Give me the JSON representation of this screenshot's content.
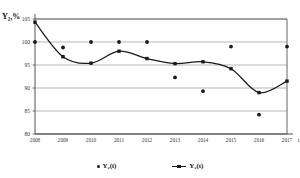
{
  "chart_data": {
    "type": "line",
    "title": "",
    "xlabel": "t, і",
    "ylabel": "Y2,%",
    "ylabel_display": "Y₂,%",
    "grid": true,
    "ylim": [
      80,
      105
    ],
    "yticks": [
      105,
      100,
      95,
      90,
      85,
      80
    ],
    "categories": [
      "2008",
      "2009",
      "2010",
      "2011",
      "2012",
      "2013",
      "2014",
      "2015",
      "2016",
      "2017"
    ],
    "x": [
      2008,
      2009,
      2010,
      2011,
      2012,
      2013,
      2014,
      2015,
      2016,
      2017
    ],
    "legend_position": "bottom",
    "series": [
      {
        "name": "Y2(i)",
        "name_display": "Y₂(i)",
        "marker": "circle",
        "style": "scatter",
        "color": "#1a1a1a",
        "values": [
          100.0,
          98.8,
          100.0,
          100.0,
          100.0,
          92.3,
          89.3,
          99.0,
          84.2,
          99.0
        ]
      },
      {
        "name": "Y2(t)",
        "name_display": "Y₂(t)",
        "marker": "square",
        "style": "line",
        "color": "#1a1a1a",
        "values": [
          104.3,
          96.8,
          95.4,
          98.0,
          96.4,
          95.3,
          95.7,
          94.2,
          89.0,
          91.5
        ]
      }
    ]
  },
  "axis": {
    "y_title": "Y₂,%",
    "x_title": "t, і",
    "ytick_labels": [
      "105",
      "100",
      "95",
      "90",
      "85",
      "80"
    ],
    "xtick_labels": [
      "2008",
      "2009",
      "2010",
      "2011",
      "2012",
      "2013",
      "2014",
      "2015",
      "2016",
      "2017"
    ]
  },
  "legend": {
    "items": [
      {
        "label": "Y₂(i)",
        "marker": "dot"
      },
      {
        "label": "Y₂(t)",
        "marker": "line-square"
      }
    ]
  },
  "colors": {
    "ink": "#1a1a1a",
    "grid": "#9a9a9a",
    "axis": "#555555",
    "background": "#ffffff"
  }
}
